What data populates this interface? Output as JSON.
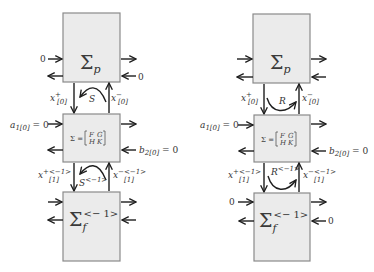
{
  "diagrams": [
    {
      "id": "left",
      "top_box": {
        "symbol": "Σ",
        "subscript": "p",
        "left_in_label": "0",
        "right_in_label": "0"
      },
      "mid_box": {
        "label": "Σ =",
        "matrix": [
          [
            "F",
            "G"
          ],
          [
            "H",
            "K"
          ]
        ],
        "left_in_label": "a",
        "left_in_sub": "1[0]",
        "left_in_eq": " = 0",
        "right_in_label": "b",
        "right_in_sub": "2[0]",
        "right_in_eq": " = 0"
      },
      "bottom_box": {
        "symbol": "Σ",
        "subscript": "f",
        "superscript": "<− 1>",
        "left_in_label": "",
        "right_in_label": ""
      },
      "upper_link": {
        "down_label": "x",
        "down_sup": "+",
        "down_sub": "[0]",
        "up_label": "x",
        "up_sup": "−",
        "up_sub": "[0]",
        "curve_label": "S",
        "curve_sup": "",
        "curve_direction": "right-to-left"
      },
      "lower_link": {
        "down_label": "x",
        "down_sup": "+<−1>",
        "down_sub": "[1]",
        "up_label": "x",
        "up_sup": "−<−1>",
        "up_sub": "[1]",
        "curve_label": "S",
        "curve_sup": "<−1>",
        "curve_direction": "right-to-left"
      }
    },
    {
      "id": "right",
      "top_box": {
        "symbol": "Σ",
        "subscript": "p",
        "left_in_label": "",
        "right_in_label": ""
      },
      "mid_box": {
        "label": "Σ =",
        "matrix": [
          [
            "F",
            "G"
          ],
          [
            "H",
            "K"
          ]
        ],
        "left_in_label": "a",
        "left_in_sub": "1[0]",
        "left_in_eq": " = 0",
        "right_in_label": "b",
        "right_in_sub": "2[0]",
        "right_in_eq": " = 0"
      },
      "bottom_box": {
        "symbol": "Σ",
        "subscript": "f",
        "superscript": "<− 1>",
        "left_in_label": "0",
        "right_in_label": "0"
      },
      "upper_link": {
        "down_label": "x",
        "down_sup": "+",
        "down_sub": "[0]",
        "up_label": "x",
        "up_sup": "−",
        "up_sub": "[0]",
        "curve_label": "R",
        "curve_sup": "",
        "curve_direction": "left-to-right"
      },
      "lower_link": {
        "down_label": "x",
        "down_sup": "+<−1>",
        "down_sub": "[1]",
        "up_label": "x",
        "up_sup": "−<−1>",
        "up_sub": "[1]",
        "curve_label": "R",
        "curve_sup": "<−1>",
        "curve_direction": "left-to-right"
      }
    }
  ]
}
